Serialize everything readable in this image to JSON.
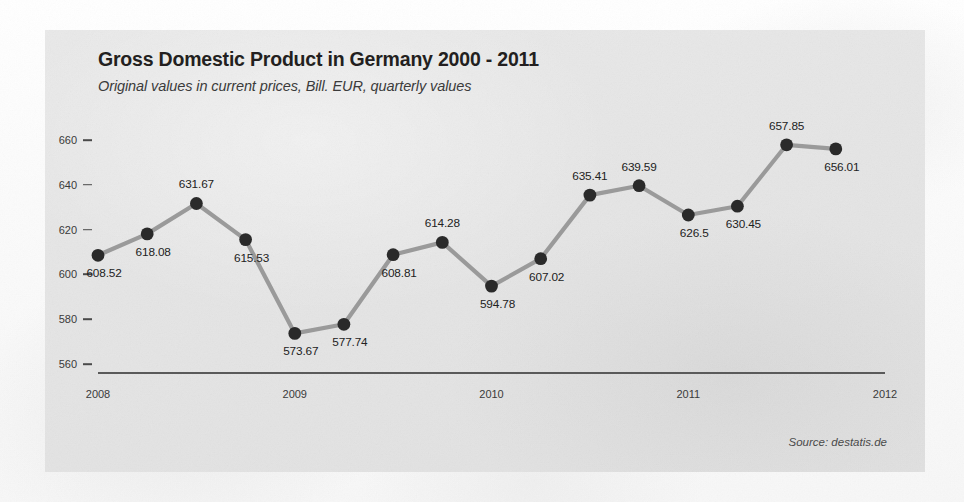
{
  "header": {
    "title": "Gross Domestic Product in Germany 2000 - 2011",
    "subtitle": "Original values in current prices, Bill. EUR, quarterly values"
  },
  "footer": {
    "source": "Source: destatis.de"
  },
  "colors": {
    "card_background": "#e5e5e5",
    "page_background": "#fbfbfb",
    "line": "#9a9a9a",
    "marker": "#2a2a2a",
    "axis": "#5a5a5a",
    "text": "#231f20"
  },
  "chart_data": {
    "type": "line",
    "title": "Gross Domestic Product in Germany 2000 - 2011",
    "subtitle": "Original values in current prices, Bill. EUR, quarterly values",
    "xlabel": "",
    "ylabel": "",
    "ylim": [
      557,
      668
    ],
    "xlim": [
      2008.0,
      2012.0
    ],
    "grid": false,
    "legend": false,
    "source": "Source: destatis.de",
    "yticks": [
      560,
      580,
      600,
      620,
      640,
      660
    ],
    "ytick_labels": [
      "560",
      "580",
      "600",
      "620",
      "640",
      "660"
    ],
    "xticks": [
      2008,
      2009,
      2010,
      2011,
      2012
    ],
    "xtick_labels": [
      "2008",
      "2009",
      "2010",
      "2011",
      "2012"
    ],
    "x": [
      2008.0,
      2008.25,
      2008.5,
      2008.75,
      2009.0,
      2009.25,
      2009.5,
      2009.75,
      2010.0,
      2010.25,
      2010.5,
      2010.75,
      2011.0,
      2011.25,
      2011.5,
      2011.75
    ],
    "categories": [
      "Q1 2008",
      "Q2 2008",
      "Q3 2008",
      "Q4 2008",
      "Q1 2009",
      "Q2 2009",
      "Q3 2009",
      "Q4 2009",
      "Q1 2010",
      "Q2 2010",
      "Q3 2010",
      "Q4 2010",
      "Q1 2011",
      "Q2 2011",
      "Q3 2011",
      "Q4 2011"
    ],
    "values": [
      608.52,
      618.08,
      631.67,
      615.53,
      573.67,
      577.74,
      608.81,
      614.28,
      594.78,
      607.02,
      635.41,
      639.59,
      626.5,
      630.45,
      657.85,
      656.01
    ],
    "point_labels": [
      "608.52",
      "618.08",
      "631.67",
      "615.53",
      "573.67",
      "577.74",
      "608.81",
      "614.28",
      "594.78",
      "607.02",
      "635.41",
      "639.59",
      "626.5",
      "630.45",
      "657.85",
      "656.01"
    ],
    "label_positions": [
      "below",
      "below",
      "above",
      "below",
      "below",
      "below",
      "below",
      "above",
      "below",
      "below",
      "above",
      "above",
      "below",
      "below",
      "above",
      "below"
    ]
  }
}
